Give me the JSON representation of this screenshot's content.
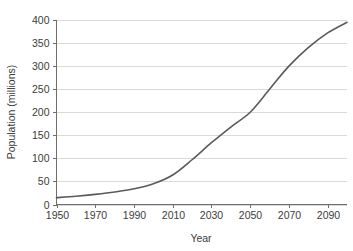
{
  "chart_data": {
    "type": "line",
    "title": "",
    "xlabel": "Year",
    "ylabel": "Population (millions)",
    "xlim": [
      1950,
      2100
    ],
    "ylim": [
      0,
      400
    ],
    "grid": true,
    "grid_axis": "y",
    "legend": "none",
    "line_color": "#5a5a5a",
    "grid_color": "#d9d9d9",
    "axis_color": "#6e6e6e",
    "background_color": "#ffffff",
    "xticks": [
      1950,
      1970,
      1990,
      2010,
      2030,
      2050,
      2070,
      2090
    ],
    "xtick_labels": [
      "1950",
      "1970",
      "1990",
      "2010",
      "2030",
      "2050",
      "2070",
      "2090"
    ],
    "yticks": [
      0,
      50,
      100,
      150,
      200,
      250,
      300,
      350,
      400
    ],
    "ytick_labels": [
      "0",
      "50",
      "100",
      "150",
      "200",
      "250",
      "300",
      "350",
      "400"
    ],
    "series": [
      {
        "name": "Population",
        "x": [
          1950,
          1960,
          1970,
          1980,
          1990,
          2000,
          2010,
          2020,
          2030,
          2040,
          2050,
          2060,
          2070,
          2080,
          2090,
          2100
        ],
        "values": [
          15,
          18,
          22,
          27,
          34,
          45,
          64,
          97,
          134,
          168,
          200,
          250,
          300,
          340,
          372,
          395
        ]
      }
    ]
  }
}
